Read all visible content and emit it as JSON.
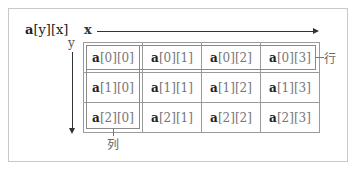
{
  "title": {
    "name": "a",
    "index_text": "[y][x]"
  },
  "axes": {
    "x_label": "x",
    "y_label": "y"
  },
  "grid": {
    "rows": [
      [
        {
          "name": "a",
          "idx": "[0][0]"
        },
        {
          "name": "a",
          "idx": "[0][1]"
        },
        {
          "name": "a",
          "idx": "[0][2]"
        },
        {
          "name": "a",
          "idx": "[0][3]"
        }
      ],
      [
        {
          "name": "a",
          "idx": "[1][0]"
        },
        {
          "name": "a",
          "idx": "[1][1]"
        },
        {
          "name": "a",
          "idx": "[1][2]"
        },
        {
          "name": "a",
          "idx": "[1][3]"
        }
      ],
      [
        {
          "name": "a",
          "idx": "[2][0]"
        },
        {
          "name": "a",
          "idx": "[2][1]"
        },
        {
          "name": "a",
          "idx": "[2][2]"
        },
        {
          "name": "a",
          "idx": "[2][3]"
        }
      ]
    ]
  },
  "annotations": {
    "row_label": "行",
    "column_label": "列"
  },
  "colors": {
    "frame_border": "#c8c8c8",
    "cell_border": "#9a9a9a",
    "arrow": "#333333",
    "index_text": "#777777"
  }
}
